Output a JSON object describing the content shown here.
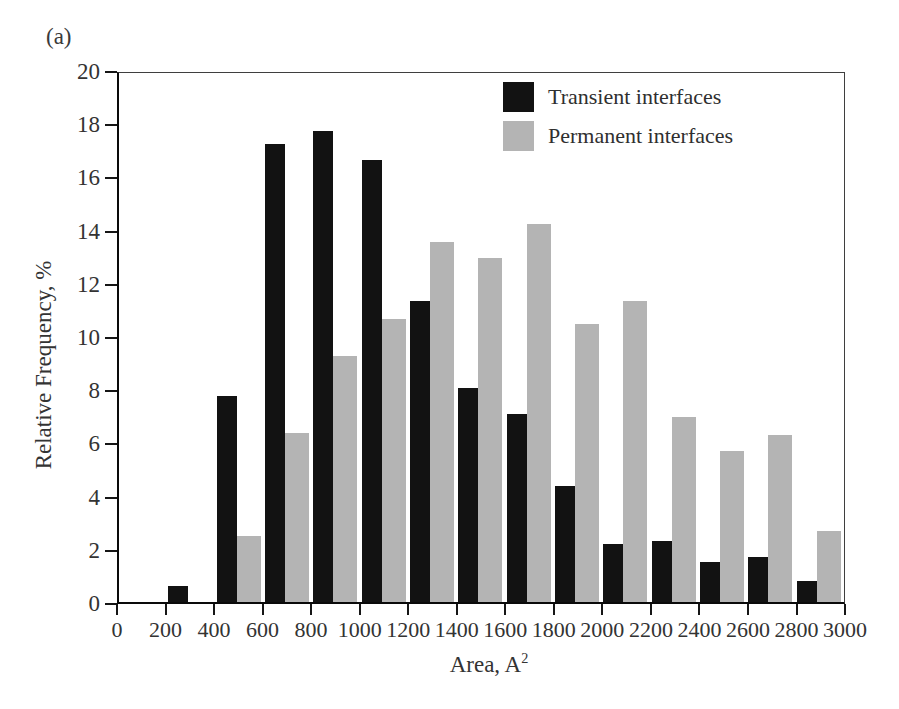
{
  "figure": {
    "panel_label": "(a)",
    "background": "#ffffff"
  },
  "chart_data": {
    "type": "bar",
    "title": "",
    "panel_label": "(a)",
    "xlabel": "Area, A²",
    "xlabel_base": "Area, A",
    "xlabel_sup": "2",
    "ylabel": "Relative Frequency, %",
    "xlim": [
      0,
      3000
    ],
    "ylim": [
      0,
      20
    ],
    "grid": false,
    "legend_position": "top-right-inside",
    "x_ticks": [
      0,
      200,
      400,
      600,
      800,
      1000,
      1200,
      1400,
      1600,
      1800,
      2000,
      2200,
      2400,
      2600,
      2800,
      3000
    ],
    "y_ticks": [
      0,
      2,
      4,
      6,
      8,
      10,
      12,
      14,
      16,
      18,
      20
    ],
    "bin_width": 200,
    "bin_starts": [
      200,
      400,
      600,
      800,
      1000,
      1200,
      1400,
      1600,
      1800,
      2000,
      2200,
      2400,
      2600,
      2800
    ],
    "series": [
      {
        "name": "Transient interfaces",
        "color": "#121212",
        "values": [
          0.6,
          7.8,
          17.3,
          17.8,
          16.7,
          11.4,
          8.1,
          7.1,
          4.4,
          2.2,
          2.3,
          1.5,
          1.7,
          0.8
        ]
      },
      {
        "name": "Permanent interfaces",
        "color": "#b4b4b4",
        "values": [
          0,
          2.5,
          6.4,
          9.3,
          10.7,
          13.6,
          13.0,
          14.3,
          10.5,
          11.4,
          7.0,
          5.7,
          6.3,
          2.7
        ]
      }
    ]
  },
  "layout_colors": {
    "axis_line": "#0a0a0a",
    "box_line": "#3f3f3f",
    "tick": "#161616",
    "text": "#333333"
  }
}
